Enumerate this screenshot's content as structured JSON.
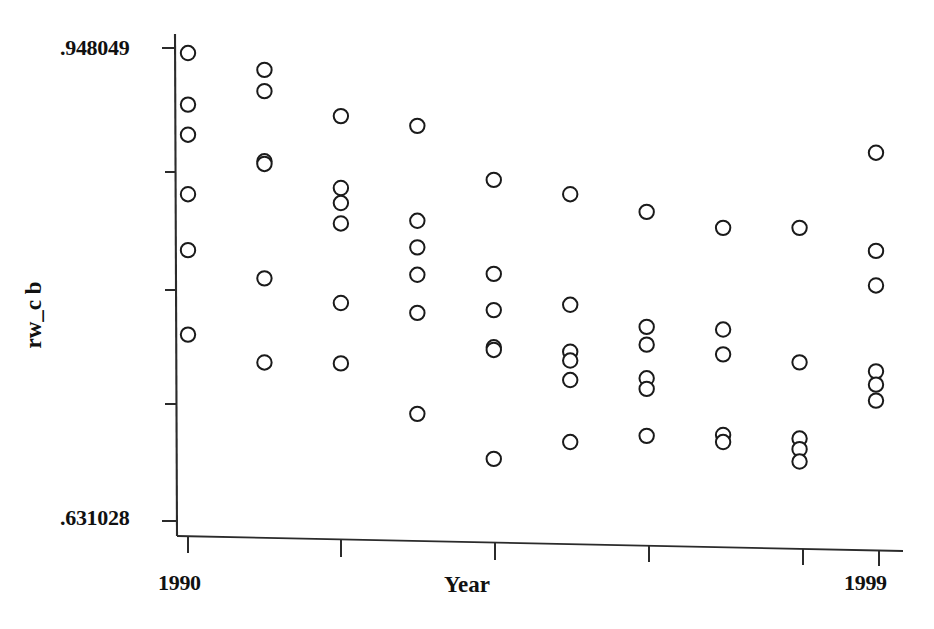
{
  "chart_data": {
    "type": "scatter",
    "title": "",
    "xlabel": "Year",
    "ylabel": "rw_c b",
    "xlim": [
      1990,
      1999
    ],
    "ylim": [
      0.631028,
      0.948049
    ],
    "grid": false,
    "legend": null,
    "marker": "open-circle",
    "y_tick_labels": [
      ".948049",
      ".631028"
    ],
    "y_tick_values": [
      0.948049,
      0.631028
    ],
    "x_tick_labels": [
      "1990",
      "1999"
    ],
    "x_tick_values": [
      1990,
      1999
    ],
    "x_minor_ticks": [
      1990,
      1992,
      1994,
      1996,
      1998,
      1999
    ],
    "y_minor_tick_count": 5,
    "categories": [
      1990,
      1991,
      1992,
      1993,
      1994,
      1995,
      1996,
      1997,
      1998,
      1999
    ],
    "points": [
      {
        "x": 1990,
        "y": 0.948
      },
      {
        "x": 1990,
        "y": 0.9131
      },
      {
        "x": 1990,
        "y": 0.8927
      },
      {
        "x": 1990,
        "y": 0.8524
      },
      {
        "x": 1990,
        "y": 0.8145
      },
      {
        "x": 1990,
        "y": 0.7573
      },
      {
        "x": 1991,
        "y": 0.9366
      },
      {
        "x": 1991,
        "y": 0.9222
      },
      {
        "x": 1991,
        "y": 0.8747
      },
      {
        "x": 1991,
        "y": 0.8729
      },
      {
        "x": 1991,
        "y": 0.7954
      },
      {
        "x": 1991,
        "y": 0.7384
      },
      {
        "x": 1992,
        "y": 0.9053
      },
      {
        "x": 1992,
        "y": 0.8566
      },
      {
        "x": 1992,
        "y": 0.8464
      },
      {
        "x": 1992,
        "y": 0.8326
      },
      {
        "x": 1992,
        "y": 0.7787
      },
      {
        "x": 1992,
        "y": 0.7378
      },
      {
        "x": 1993,
        "y": 0.8987
      },
      {
        "x": 1993,
        "y": 0.8344
      },
      {
        "x": 1993,
        "y": 0.8164
      },
      {
        "x": 1993,
        "y": 0.7978
      },
      {
        "x": 1993,
        "y": 0.772
      },
      {
        "x": 1993,
        "y": 0.7036
      },
      {
        "x": 1994,
        "y": 0.8621
      },
      {
        "x": 1994,
        "y": 0.7984
      },
      {
        "x": 1994,
        "y": 0.7739
      },
      {
        "x": 1994,
        "y": 0.7487
      },
      {
        "x": 1994,
        "y": 0.7469
      },
      {
        "x": 1994,
        "y": 0.6731
      },
      {
        "x": 1995,
        "y": 0.8524
      },
      {
        "x": 1995,
        "y": 0.7775
      },
      {
        "x": 1995,
        "y": 0.7457
      },
      {
        "x": 1995,
        "y": 0.7397
      },
      {
        "x": 1995,
        "y": 0.7265
      },
      {
        "x": 1995,
        "y": 0.6845
      },
      {
        "x": 1996,
        "y": 0.8404
      },
      {
        "x": 1996,
        "y": 0.7625
      },
      {
        "x": 1996,
        "y": 0.7505
      },
      {
        "x": 1996,
        "y": 0.7277
      },
      {
        "x": 1996,
        "y": 0.7205
      },
      {
        "x": 1996,
        "y": 0.6887
      },
      {
        "x": 1997,
        "y": 0.8296
      },
      {
        "x": 1997,
        "y": 0.7607
      },
      {
        "x": 1997,
        "y": 0.7439
      },
      {
        "x": 1997,
        "y": 0.6893
      },
      {
        "x": 1997,
        "y": 0.6845
      },
      {
        "x": 1998,
        "y": 0.8296
      },
      {
        "x": 1998,
        "y": 0.7385
      },
      {
        "x": 1998,
        "y": 0.6869
      },
      {
        "x": 1998,
        "y": 0.6797
      },
      {
        "x": 1998,
        "y": 0.6713
      },
      {
        "x": 1999,
        "y": 0.8805
      },
      {
        "x": 1999,
        "y": 0.814
      },
      {
        "x": 1999,
        "y": 0.7906
      },
      {
        "x": 1999,
        "y": 0.7324
      },
      {
        "x": 1999,
        "y": 0.7234
      },
      {
        "x": 1999,
        "y": 0.7126
      }
    ]
  },
  "axes": {
    "y_max_label": ".948049",
    "y_min_label": ".631028",
    "x_min_label": "1990",
    "x_max_label": "1999",
    "x_title": "Year",
    "y_title": "rw_c b"
  },
  "style": {
    "marker_stroke": "#1a1a1a",
    "marker_fill": "#ffffff",
    "axis_color": "#2b2b2b",
    "background": "#ffffff"
  }
}
